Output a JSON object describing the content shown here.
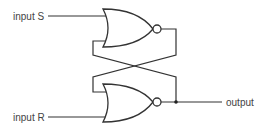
{
  "diagram": {
    "labels": {
      "input_s": "input S",
      "input_r": "input R",
      "output": "output"
    },
    "gates": [
      {
        "id": "nor-top",
        "type": "NOR"
      },
      {
        "id": "nor-bottom",
        "type": "NOR"
      }
    ],
    "colors": {
      "line": "#333333",
      "text": "#444444",
      "background": "#ffffff"
    }
  }
}
